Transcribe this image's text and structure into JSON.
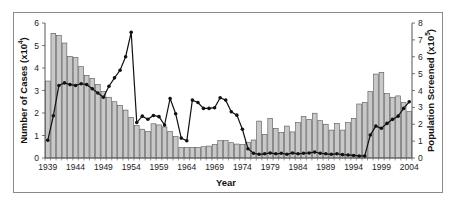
{
  "chart_data": {
    "type": "bar+line",
    "title": "",
    "xlabel": "Year",
    "ylabel_left": "Number of Cases (x10^4)",
    "ylabel_right": "Population Screened (x10^5)",
    "ylim_left": [
      0,
      6
    ],
    "ylim_right": [
      0,
      8
    ],
    "yticks_left": [
      0,
      1,
      2,
      3,
      4,
      5,
      6
    ],
    "yticks_right": [
      0,
      1,
      2,
      3,
      4,
      5,
      6,
      7,
      8
    ],
    "x_tick_labels": [
      "1939",
      "1944",
      "1949",
      "1954",
      "1959",
      "1964",
      "1969",
      "1974",
      "1979",
      "1984",
      "1989",
      "1994",
      "1999",
      "2004"
    ],
    "grid": false,
    "legend": null,
    "years": [
      1939,
      1940,
      1941,
      1942,
      1943,
      1944,
      1945,
      1946,
      1947,
      1948,
      1949,
      1950,
      1951,
      1952,
      1953,
      1954,
      1955,
      1956,
      1957,
      1958,
      1959,
      1960,
      1961,
      1962,
      1963,
      1964,
      1965,
      1966,
      1967,
      1968,
      1969,
      1970,
      1971,
      1972,
      1973,
      1974,
      1975,
      1976,
      1977,
      1978,
      1979,
      1980,
      1981,
      1982,
      1983,
      1984,
      1985,
      1986,
      1987,
      1988,
      1989,
      1990,
      1991,
      1992,
      1993,
      1994,
      1995,
      1996,
      1997,
      1998,
      1999,
      2000,
      2001,
      2002,
      2003,
      2004
    ],
    "series": [
      {
        "name": "Number of Cases (x10^4)",
        "type": "bar",
        "axis": "left",
        "color": "#c8c8c8",
        "values": [
          3.42,
          5.54,
          5.44,
          5.11,
          4.52,
          4.46,
          4.06,
          3.67,
          3.54,
          3.27,
          2.95,
          2.7,
          2.5,
          2.34,
          2.13,
          1.81,
          1.45,
          1.28,
          1.17,
          1.52,
          1.47,
          1.38,
          1.17,
          0.95,
          0.47,
          0.47,
          0.47,
          0.47,
          0.5,
          0.53,
          0.6,
          0.77,
          0.77,
          0.68,
          0.62,
          0.6,
          0.7,
          0.8,
          1.64,
          1.05,
          1.76,
          1.32,
          1.13,
          1.42,
          1.16,
          1.57,
          1.84,
          1.72,
          1.99,
          1.66,
          1.5,
          1.24,
          1.54,
          1.24,
          1.57,
          1.76,
          2.4,
          2.47,
          2.95,
          3.73,
          3.81,
          2.87,
          2.7,
          2.76,
          2.46,
          2.06
        ]
      },
      {
        "name": "Population Screened (x10^5)",
        "type": "line",
        "axis": "right",
        "color": "#111111",
        "values": [
          1.05,
          2.5,
          4.3,
          4.45,
          4.35,
          4.3,
          4.4,
          4.35,
          4.1,
          3.85,
          3.6,
          4.25,
          4.75,
          5.2,
          6.0,
          7.45,
          2.1,
          2.48,
          2.3,
          2.52,
          2.45,
          1.95,
          3.53,
          2.62,
          1.18,
          1.02,
          3.43,
          3.29,
          2.94,
          2.94,
          2.98,
          3.57,
          3.43,
          2.74,
          2.54,
          1.7,
          0.55,
          0.28,
          0.22,
          0.25,
          0.3,
          0.25,
          0.28,
          0.22,
          0.3,
          0.25,
          0.28,
          0.3,
          0.35,
          0.28,
          0.25,
          0.22,
          0.25,
          0.2,
          0.18,
          0.15,
          0.12,
          0.12,
          1.36,
          1.89,
          1.76,
          2.05,
          2.29,
          2.48,
          2.94,
          3.33
        ]
      }
    ]
  }
}
